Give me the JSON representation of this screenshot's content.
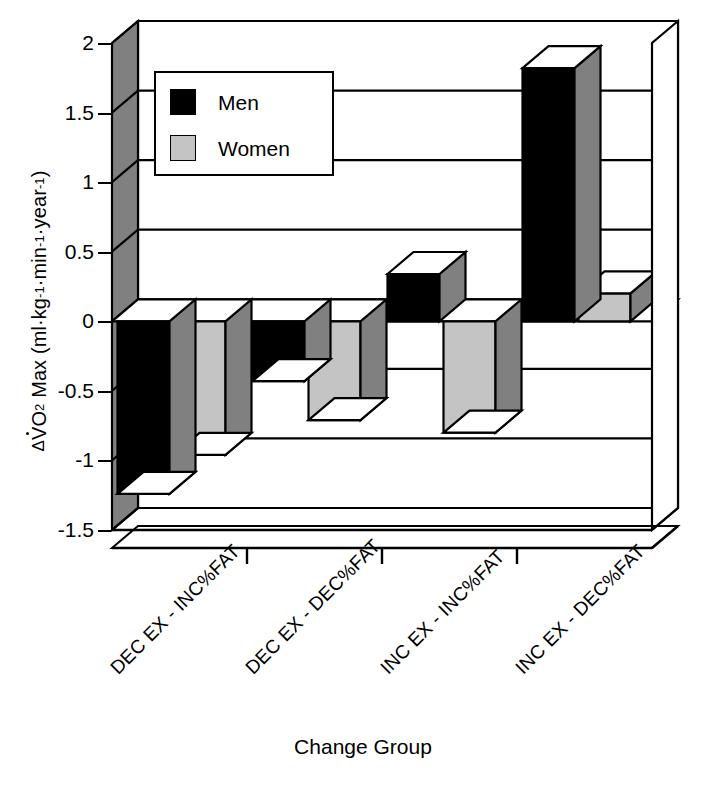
{
  "chart_data": {
    "type": "bar",
    "title": "",
    "subtitle": "",
    "xlabel": "Change Group",
    "ylabel": "ΔV̇O2 Max (ml·kg-1·min-1·year-1)",
    "ylabel_parts": {
      "delta": "Δ",
      "v_dot": "V",
      "o": "O",
      "o_sub": "2",
      "max": "Max (ml·kg",
      "exp1": "-1",
      "mid1": "·min",
      "exp2": "-1",
      "mid2": "·year",
      "exp3": "-1",
      "close": ")"
    },
    "categories": [
      "DEC EX - INC%FAT",
      "DEC EX - DEC%FAT",
      "INC EX - INC%FAT",
      "INC EX - DEC%FAT"
    ],
    "series": [
      {
        "name": "Men",
        "color": "#000000",
        "values": [
          -1.24,
          -0.43,
          0.34,
          1.82
        ]
      },
      {
        "name": "Women",
        "color": "#c4c4c4",
        "values": [
          -0.96,
          -0.71,
          -0.8,
          0.2
        ]
      }
    ],
    "ylim": [
      -1.5,
      2
    ],
    "yticks": [
      2,
      1.5,
      1,
      0.5,
      0,
      -0.5,
      -1,
      -1.5
    ],
    "ytick_labels": [
      "2",
      "1.5",
      "1",
      "0.5",
      "0",
      "-0.5",
      "-1",
      "-1.5"
    ],
    "grid": true,
    "grid_axis": "y",
    "legend_position": "upper-left-inside",
    "style": "3d-bar",
    "colors": {
      "men": "#000000",
      "women": "#c4c4c4",
      "axis_wall": "#808080",
      "side_shade": "#808080",
      "outline": "#000000",
      "background": "#ffffff"
    }
  },
  "legend": {
    "entries": [
      {
        "label": "Men"
      },
      {
        "label": "Women"
      }
    ]
  }
}
